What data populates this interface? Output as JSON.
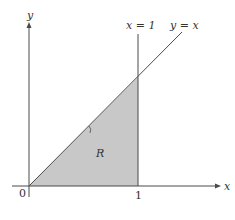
{
  "figure": {
    "axes": {
      "x_label": "x",
      "y_label": "y",
      "origin_label": "0",
      "x_tick_label": "1"
    },
    "lines": {
      "vertical_label": "x = 1",
      "diagonal_label": "y = x"
    },
    "region": {
      "label": "R",
      "fill": "#c8c8c8"
    },
    "colors": {
      "stroke": "#4a4a4a",
      "text": "#333333"
    }
  }
}
